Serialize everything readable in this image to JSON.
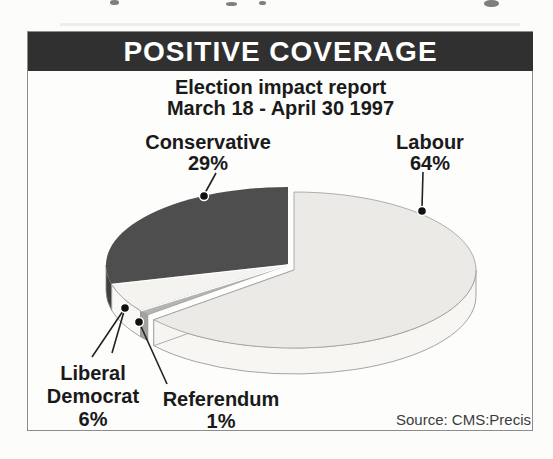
{
  "header": {
    "title": "POSITIVE COVERAGE"
  },
  "subtitle": {
    "line1": "Election impact report",
    "line2": "March 18 - April 30 1997"
  },
  "labels": {
    "conservative": {
      "name": "Conservative",
      "pct": "29%"
    },
    "labour": {
      "name": "Labour",
      "pct": "64%"
    },
    "libdem": {
      "line1": "Liberal",
      "line2": "Democrat",
      "pct": "6%"
    },
    "referendum": {
      "name": "Referendum",
      "pct": "1%"
    }
  },
  "source": {
    "text": "Source: CMS:Precis"
  },
  "colors": {
    "header_bar": "#303030",
    "frame_border": "#8c8c8c",
    "background": "#fcfcfa",
    "text": "#1a1a1a",
    "source_text": "#3c3c3c",
    "dot": "#111111",
    "leader_line": "#222222",
    "rim_stroke": "#8e8e8e",
    "separator": "#ffffff"
  },
  "chart_data": {
    "type": "pie",
    "title": "POSITIVE COVERAGE",
    "subtitle": "Election impact report March 18 - April 30 1997",
    "unit": "%",
    "style": "3d-exploded",
    "order_clockwise_from_top": true,
    "slices": [
      {
        "name": "Labour",
        "value": 64,
        "color": "#ebeae6",
        "side_color": "#f7f6f3"
      },
      {
        "name": "Referendum",
        "value": 1,
        "color": "#b4b4b2",
        "side_color": "#a2a2a0"
      },
      {
        "name": "Liberal Democrat",
        "value": 6,
        "color": "#f4f3f0",
        "side_color": "#f9f8f5"
      },
      {
        "name": "Conservative",
        "value": 29,
        "color": "#4e4e4e",
        "side_color": "#404040"
      }
    ],
    "source": "Source: CMS:Precis"
  }
}
